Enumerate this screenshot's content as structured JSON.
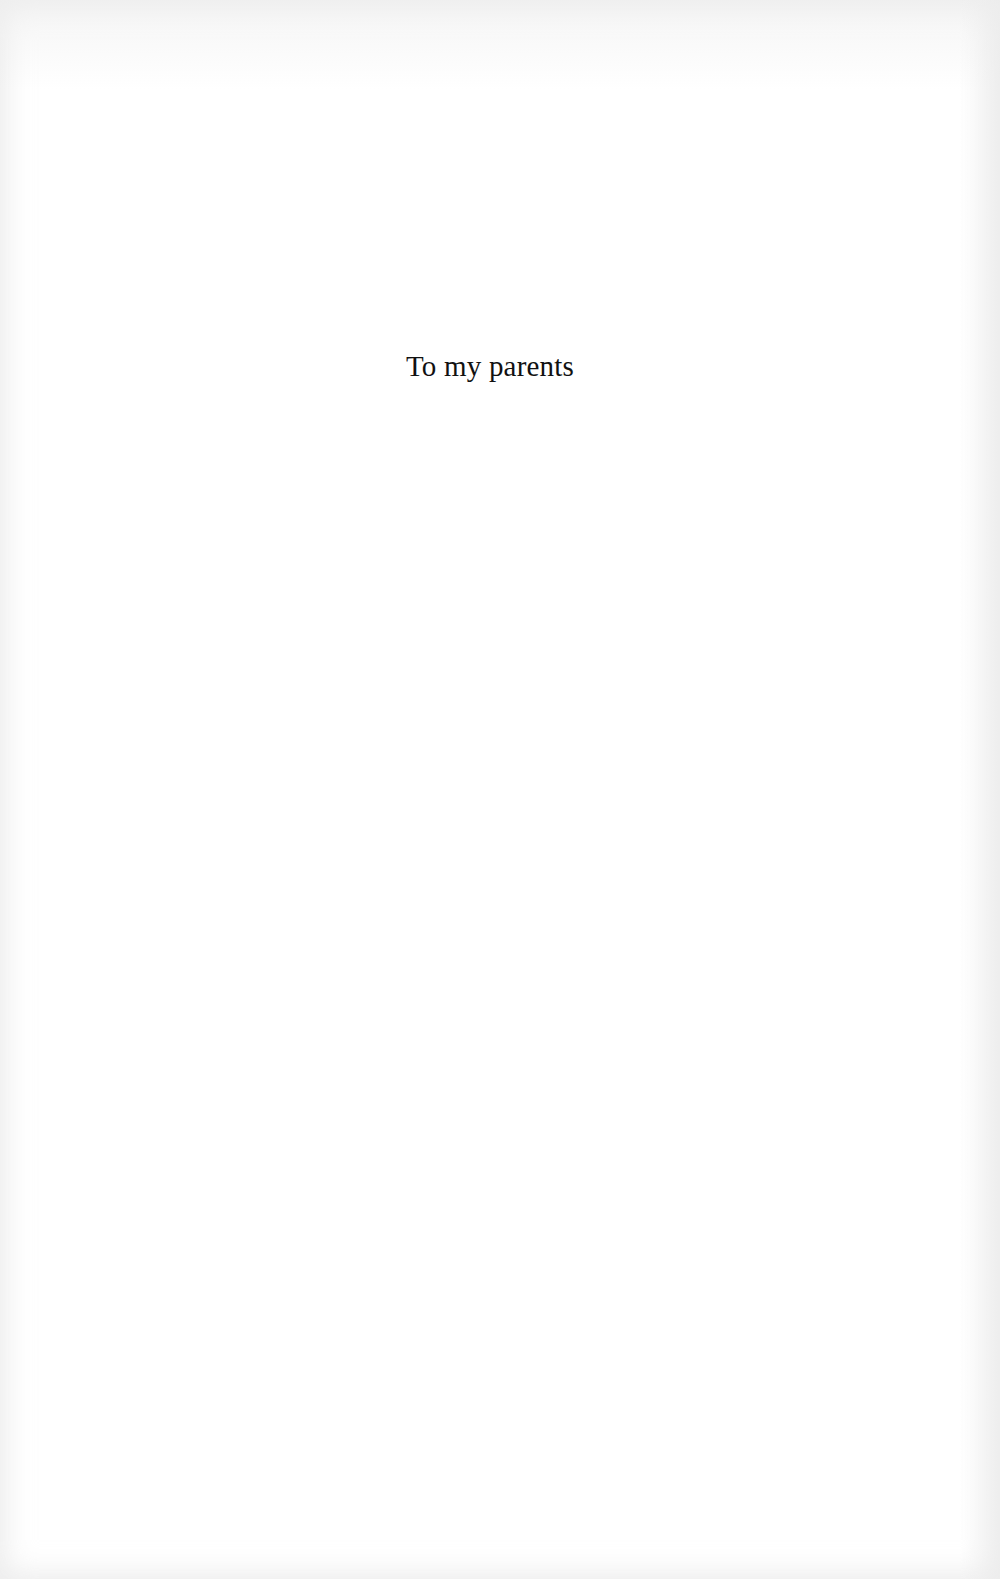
{
  "page": {
    "type": "dedication",
    "dedication_text": "To my parents"
  },
  "colors": {
    "paper": "#ffffff",
    "text": "#111111"
  }
}
